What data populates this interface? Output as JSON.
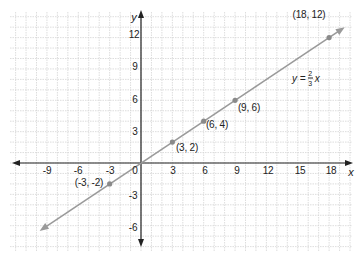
{
  "chart_data": {
    "type": "line",
    "title": "",
    "xlabel": "x",
    "ylabel": "y",
    "xlim": [
      -12.5,
      20
    ],
    "ylim": [
      -8.5,
      14.5
    ],
    "grid": true,
    "x_ticks": [
      -9,
      -6,
      -3,
      3,
      6,
      9,
      12,
      15,
      18
    ],
    "y_ticks": [
      12,
      9,
      6,
      3,
      -3,
      -6
    ],
    "origin_label": "0",
    "series": [
      {
        "name": "y = 2/3 x",
        "equation": "y = (2/3)x",
        "slope": 0.6667,
        "intercept": 0,
        "line_from": [
          -9.7,
          -6.5
        ],
        "line_to": [
          19.5,
          13
        ],
        "points": [
          {
            "x": -3,
            "y": -2,
            "label": "(-3, -2)"
          },
          {
            "x": 3,
            "y": 2,
            "label": "(3, 2)"
          },
          {
            "x": 6,
            "y": 4,
            "label": "(6, 4)"
          },
          {
            "x": 9,
            "y": 6,
            "label": "(9, 6)"
          },
          {
            "x": 18,
            "y": 12,
            "label": "(18, 12)"
          }
        ]
      }
    ],
    "annotations": [
      {
        "text": "y = 2/3 x",
        "numerator": "2",
        "denominator": "3"
      }
    ],
    "colors": {
      "line": "#9a9a9a",
      "points": "#8a8a8a",
      "axis": "#222222",
      "grid": "#d4d4d4"
    }
  },
  "labels": {
    "x_axis": "x",
    "y_axis": "y",
    "origin": "0",
    "eq_prefix": "y =",
    "eq_num": "2",
    "eq_den": "3",
    "eq_var": "x",
    "xt": [
      "-9",
      "-6",
      "-3",
      "3",
      "6",
      "9",
      "12",
      "15",
      "18"
    ],
    "yt": [
      "12",
      "9",
      "6",
      "3",
      "-3",
      "-6"
    ],
    "pts": [
      "(-3, -2)",
      "(3, 2)",
      "(6, 4)",
      "(9, 6)",
      "(18, 12)"
    ]
  }
}
